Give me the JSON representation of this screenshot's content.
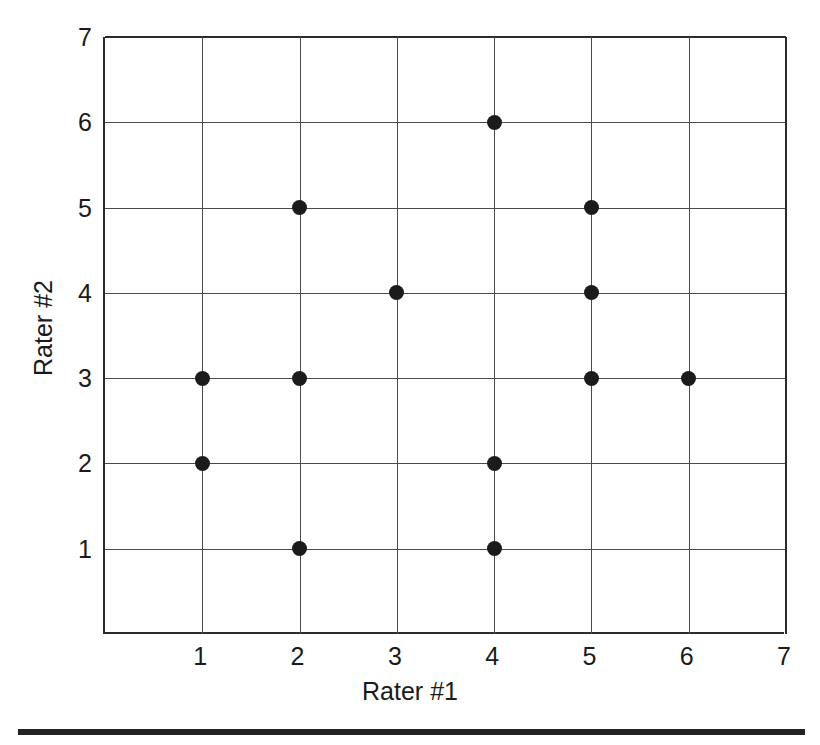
{
  "chart_data": {
    "type": "scatter",
    "title": "",
    "xlabel": "Rater #1",
    "ylabel": "Rater #2",
    "xlim": [
      0,
      7
    ],
    "ylim": [
      0,
      7
    ],
    "xticks": [
      1,
      2,
      3,
      4,
      5,
      6,
      7
    ],
    "yticks": [
      1,
      2,
      3,
      4,
      5,
      6,
      7
    ],
    "xtick_labels": [
      "1",
      "2",
      "3",
      "4",
      "5",
      "6",
      "7"
    ],
    "ytick_labels": [
      "1",
      "2",
      "3",
      "4",
      "5",
      "6",
      "7"
    ],
    "grid": true,
    "legend": null,
    "marker": "filled-circle",
    "marker_color": "#1b1b1b",
    "grid_color": "#4a4a4a",
    "axis_color": "#2b2b2b",
    "background": "#ffffff",
    "point_count": 13,
    "points": [
      {
        "x": 1,
        "y": 2
      },
      {
        "x": 1,
        "y": 3
      },
      {
        "x": 2,
        "y": 1
      },
      {
        "x": 2,
        "y": 3
      },
      {
        "x": 2,
        "y": 5
      },
      {
        "x": 3,
        "y": 4
      },
      {
        "x": 4,
        "y": 1
      },
      {
        "x": 4,
        "y": 2
      },
      {
        "x": 4,
        "y": 6
      },
      {
        "x": 5,
        "y": 3
      },
      {
        "x": 5,
        "y": 4
      },
      {
        "x": 5,
        "y": 5
      },
      {
        "x": 6,
        "y": 3
      }
    ]
  }
}
